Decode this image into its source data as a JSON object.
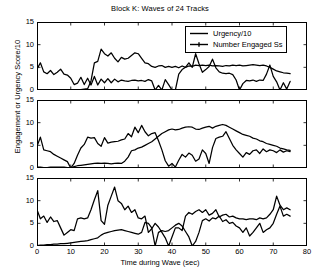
{
  "chart_data": {
    "type": "line",
    "title": "Block K: Waves of 24 Tracks",
    "xlabel": "Time during Wave (sec)",
    "ylabel": "Engagement or Urgency Score/10",
    "xlim": [
      0,
      80
    ],
    "ylim": [
      0,
      15
    ],
    "xticks": [
      0,
      10,
      20,
      30,
      40,
      50,
      60,
      70,
      80
    ],
    "yticks": [
      0,
      5,
      10,
      15
    ],
    "grid": false,
    "legend": {
      "position": "top-right-panel-1",
      "entries": [
        {
          "name": "Urgency/10",
          "marker": "none",
          "color": "#000000"
        },
        {
          "name": "Number Engaged Ss",
          "marker": "line-with-tick",
          "color": "#000000"
        }
      ]
    },
    "panels": [
      {
        "index": 1,
        "series": [
          {
            "name": "Number Engaged Ss",
            "x": [
              0,
              1,
              2,
              3,
              4,
              5,
              6,
              7,
              8,
              9,
              10,
              11,
              12,
              13,
              14,
              15,
              16,
              17,
              18,
              19,
              20,
              21,
              22,
              23,
              24,
              25,
              26,
              27,
              28,
              29,
              30,
              31,
              32,
              33,
              34,
              35,
              36,
              37,
              38,
              39,
              40,
              41,
              42,
              43,
              44,
              45,
              46,
              47,
              48,
              49,
              50,
              51,
              52,
              53,
              54,
              55,
              56,
              57,
              58,
              59,
              60,
              61,
              62,
              63,
              64,
              65,
              66,
              67,
              68,
              69,
              70,
              71,
              72,
              73,
              74,
              75
            ],
            "values": [
              4.6,
              6.0,
              4.0,
              3.6,
              4.3,
              3.4,
              3.9,
              4.6,
              3.5,
              3.3,
              2.6,
              1.2,
              1.5,
              2.8,
              1.2,
              2.6,
              1.1,
              3.0,
              1.1,
              2.4,
              1.6,
              2.5,
              1.6,
              2.4,
              1.8,
              2.2,
              2.0,
              1.9,
              2.1,
              2.2,
              2.0,
              2.1,
              1.9,
              2.3,
              2.0,
              0.0,
              1.0,
              0.0,
              2.3,
              1.2,
              0.0,
              0.0,
              3.5,
              4.5,
              5.0,
              6.0,
              5.0,
              8.0,
              5.8,
              3.9,
              4.5,
              5.2,
              6.8,
              4.9,
              4.0,
              3.7,
              3.6,
              3.7,
              3.4,
              2.2,
              0.0,
              1.4,
              2.1,
              2.0,
              2.2,
              1.9,
              2.2,
              2.1,
              3.5,
              5.5,
              3.0,
              1.8,
              0.0,
              1.6,
              0.2,
              1.9
            ]
          },
          {
            "name": "Urgency/10",
            "x": [
              0,
              1,
              2,
              3,
              4,
              5,
              6,
              7,
              8,
              9,
              10,
              11,
              12,
              13,
              14,
              15,
              16,
              17,
              18,
              19,
              20,
              21,
              22,
              23,
              24,
              25,
              26,
              27,
              28,
              29,
              30,
              31,
              32,
              33,
              34,
              35,
              36,
              37,
              38,
              39,
              40,
              41,
              42,
              43,
              44,
              45,
              46,
              47,
              48,
              49,
              50,
              51,
              52,
              53,
              54,
              55,
              56,
              57,
              58,
              59,
              60,
              61,
              62,
              63,
              64,
              65,
              66,
              67,
              68,
              69,
              70,
              71,
              72,
              73,
              74,
              75
            ],
            "values": [
              0.0,
              0.0,
              0.0,
              0.0,
              0.0,
              0.0,
              0.0,
              0.0,
              0.0,
              0.0,
              0.0,
              0.0,
              0.05,
              0.1,
              0.2,
              0.3,
              2.0,
              6.0,
              6.3,
              9.0,
              8.0,
              7.5,
              8.2,
              7.0,
              6.2,
              7.2,
              6.8,
              7.0,
              7.6,
              8.2,
              8.0,
              7.0,
              6.0,
              5.8,
              5.2,
              5.0,
              5.3,
              5.4,
              5.0,
              5.2,
              5.0,
              5.2,
              4.9,
              5.3,
              5.0,
              5.3,
              5.2,
              5.5,
              5.4,
              5.5,
              5.4,
              5.5,
              5.3,
              5.4,
              5.3,
              5.2,
              5.4,
              5.3,
              5.5,
              5.4,
              5.5,
              5.3,
              5.4,
              5.5,
              5.6,
              5.5,
              5.4,
              5.5,
              5.3,
              5.0,
              4.6,
              4.2,
              4.0,
              3.8,
              3.7,
              3.6
            ]
          }
        ]
      },
      {
        "index": 2,
        "series": [
          {
            "name": "Number Engaged Ss",
            "x": [
              0,
              1,
              2,
              3,
              4,
              5,
              6,
              7,
              8,
              9,
              10,
              11,
              12,
              13,
              14,
              15,
              16,
              17,
              18,
              19,
              20,
              21,
              22,
              23,
              24,
              25,
              26,
              27,
              28,
              29,
              30,
              31,
              32,
              33,
              34,
              35,
              36,
              37,
              38,
              39,
              40,
              41,
              42,
              43,
              44,
              45,
              46,
              47,
              48,
              49,
              50,
              51,
              52,
              53,
              54,
              55,
              56,
              57,
              58,
              59,
              60,
              61,
              62,
              63,
              64,
              65,
              66,
              67,
              68,
              69,
              70,
              71,
              72,
              73,
              74,
              75
            ],
            "values": [
              4.8,
              6.8,
              4.0,
              3.8,
              3.6,
              3.0,
              2.6,
              2.2,
              1.8,
              1.4,
              0.0,
              1.0,
              2.8,
              4.4,
              5.2,
              6.8,
              6.6,
              6.7,
              5.4,
              4.8,
              6.7,
              5.5,
              5.7,
              5.8,
              5.9,
              6.2,
              6.4,
              7.6,
              6.9,
              9.0,
              7.8,
              9.4,
              8.0,
              7.1,
              7.6,
              7.8,
              6.0,
              4.0,
              1.6,
              0.4,
              1.0,
              0.2,
              1.7,
              3.0,
              2.4,
              3.3,
              2.8,
              1.5,
              2.0,
              4.0,
              3.2,
              1.0,
              4.5,
              6.5,
              6.8,
              7.0,
              8.0,
              6.5,
              5.0,
              4.0,
              3.2,
              2.4,
              3.4,
              3.0,
              3.8,
              4.0,
              3.2,
              4.2,
              3.6,
              4.0,
              3.8,
              3.4,
              4.0,
              3.5,
              3.8,
              3.6
            ]
          },
          {
            "name": "Urgency/10",
            "x": [
              0,
              1,
              2,
              3,
              4,
              5,
              6,
              7,
              8,
              9,
              10,
              11,
              12,
              13,
              14,
              15,
              16,
              17,
              18,
              19,
              20,
              21,
              22,
              23,
              24,
              25,
              26,
              27,
              28,
              29,
              30,
              31,
              32,
              33,
              34,
              35,
              36,
              37,
              38,
              39,
              40,
              41,
              42,
              43,
              44,
              45,
              46,
              47,
              48,
              49,
              50,
              51,
              52,
              53,
              54,
              55,
              56,
              57,
              58,
              59,
              60,
              61,
              62,
              63,
              64,
              65,
              66,
              67,
              68,
              69,
              70,
              71,
              72,
              73,
              74,
              75
            ],
            "values": [
              0.2,
              0.2,
              0.1,
              0.1,
              0.2,
              0.2,
              0.2,
              0.2,
              0.2,
              0.1,
              0.0,
              0.3,
              0.5,
              0.6,
              0.7,
              0.8,
              0.9,
              1.0,
              1.1,
              1.0,
              1.1,
              1.0,
              0.9,
              1.0,
              1.1,
              1.0,
              1.5,
              2.4,
              3.8,
              4.0,
              4.4,
              4.6,
              5.0,
              5.4,
              5.8,
              6.4,
              7.0,
              7.6,
              8.0,
              8.4,
              8.6,
              8.4,
              8.5,
              8.8,
              9.0,
              9.1,
              9.0,
              8.6,
              8.5,
              8.8,
              9.0,
              9.2,
              8.8,
              9.2,
              9.4,
              9.6,
              9.4,
              9.0,
              8.6,
              8.2,
              7.8,
              7.4,
              7.2,
              7.0,
              6.6,
              6.4,
              6.0,
              5.8,
              5.4,
              5.2,
              5.0,
              4.8,
              4.4,
              4.2,
              4.0,
              3.9
            ]
          }
        ]
      },
      {
        "index": 3,
        "series": [
          {
            "name": "Number Engaged Ss",
            "x": [
              0,
              1,
              2,
              3,
              4,
              5,
              6,
              7,
              8,
              9,
              10,
              11,
              12,
              13,
              14,
              15,
              16,
              17,
              18,
              19,
              20,
              21,
              22,
              23,
              24,
              25,
              26,
              27,
              28,
              29,
              30,
              31,
              32,
              33,
              34,
              35,
              36,
              37,
              38,
              39,
              40,
              41,
              42,
              43,
              44,
              45,
              46,
              47,
              48,
              49,
              50,
              51,
              52,
              53,
              54,
              55,
              56,
              57,
              58,
              59,
              60,
              61,
              62,
              63,
              64,
              65,
              66,
              67,
              68,
              69,
              70,
              71,
              72,
              73,
              74,
              75
            ],
            "values": [
              8.0,
              6.0,
              6.6,
              5.2,
              6.4,
              5.4,
              5.6,
              4.0,
              2.4,
              3.0,
              3.6,
              3.4,
              6.0,
              6.2,
              6.0,
              6.2,
              8.0,
              10.2,
              12.2,
              5.6,
              4.8,
              9.0,
              11.0,
              13.0,
              10.0,
              9.4,
              8.0,
              8.8,
              7.4,
              8.0,
              6.2,
              6.0,
              6.6,
              3.0,
              3.8,
              5.0,
              4.2,
              3.0,
              1.8,
              0.0,
              2.0,
              4.0,
              4.0,
              3.4,
              6.6,
              7.4,
              7.0,
              7.6,
              8.0,
              7.4,
              8.0,
              6.8,
              7.2,
              8.0,
              6.4,
              6.8,
              7.0,
              6.4,
              6.6,
              6.2,
              6.0,
              6.0,
              5.8,
              6.0,
              6.0,
              5.8,
              6.2,
              6.0,
              6.2,
              7.0,
              8.0,
              11.0,
              9.0,
              8.0,
              8.4,
              8.0
            ]
          },
          {
            "name": "Urgency/10",
            "x": [
              0,
              1,
              2,
              3,
              4,
              5,
              6,
              7,
              8,
              9,
              10,
              11,
              12,
              13,
              14,
              15,
              16,
              17,
              18,
              19,
              20,
              21,
              22,
              23,
              24,
              25,
              26,
              27,
              28,
              29,
              30,
              31,
              32,
              33,
              34,
              35,
              36,
              37,
              38,
              39,
              40,
              41,
              42,
              43,
              44,
              45,
              46,
              47,
              48,
              49,
              50,
              51,
              52,
              53,
              54,
              55,
              56,
              57,
              58,
              59,
              60,
              61,
              62,
              63,
              64,
              65,
              66,
              67,
              68,
              69,
              70,
              71,
              72,
              73,
              74,
              75
            ],
            "values": [
              0.1,
              0.2,
              0.2,
              0.3,
              0.3,
              0.4,
              0.4,
              0.5,
              0.5,
              0.6,
              0.7,
              0.8,
              0.9,
              1.0,
              1.1,
              1.2,
              1.4,
              1.6,
              1.8,
              2.4,
              2.8,
              3.0,
              3.2,
              3.4,
              3.5,
              3.6,
              3.4,
              3.2,
              3.0,
              2.8,
              2.6,
              3.0,
              5.2,
              5.0,
              4.0,
              0.0,
              3.0,
              3.4,
              3.2,
              3.4,
              4.0,
              4.6,
              5.0,
              4.4,
              3.2,
              2.0,
              0.0,
              1.0,
              3.0,
              5.6,
              6.0,
              5.5,
              6.2,
              6.0,
              6.6,
              5.4,
              5.8,
              5.0,
              5.2,
              4.4,
              4.0,
              3.0,
              4.0,
              2.2,
              3.0,
              4.0,
              5.0,
              3.0,
              3.6,
              4.0,
              5.0,
              7.0,
              8.8,
              6.6,
              7.0,
              6.6
            ]
          }
        ]
      }
    ]
  }
}
